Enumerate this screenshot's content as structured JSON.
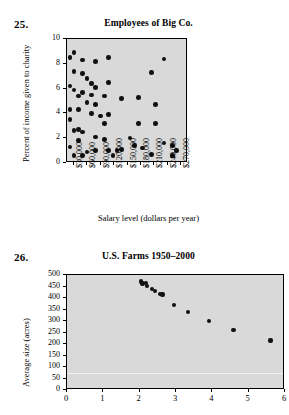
{
  "figures": [
    {
      "number": "25.",
      "title": "Employees of Big Co.",
      "xlabel": "Salary level (dollars per year)",
      "ylabel": "Percent of income given to charity",
      "ytick_labels": [
        "10",
        "8",
        "6",
        "4",
        "2",
        "0"
      ],
      "xtick_labels": [
        "$30,000",
        "$60,000",
        "$90,000",
        "$120,000",
        "$150,000",
        "$180,000",
        "$210,000",
        "$240,000",
        "$270,000"
      ]
    },
    {
      "number": "26.",
      "title": "U.S. Farms 1950–2000",
      "xlabel": "",
      "ylabel": "Average size (acres)",
      "ytick_labels": [
        "500",
        "450",
        "400",
        "350",
        "300",
        "250",
        "200",
        "150",
        "100",
        "50",
        "0"
      ],
      "xtick_labels": [
        "0",
        "1",
        "2",
        "3",
        "4",
        "5",
        "6"
      ]
    }
  ],
  "chart_data": [
    {
      "type": "scatter",
      "title": "Employees of Big Co.",
      "xlabel": "Salary level (dollars per year)",
      "ylabel": "Percent of income given to charity",
      "xlim": [
        15000,
        285000
      ],
      "ylim": [
        0,
        10
      ],
      "grid": false,
      "legend": "none",
      "marker": "filled-circle",
      "xtick_values": [
        30000,
        60000,
        90000,
        120000,
        150000,
        180000,
        210000,
        240000,
        270000
      ],
      "ytick_values": [
        0,
        2,
        4,
        6,
        8,
        10
      ],
      "points": [
        {
          "x": 22000,
          "y": 8.5
        },
        {
          "x": 22000,
          "y": 6.2
        },
        {
          "x": 22000,
          "y": 4.3
        },
        {
          "x": 22000,
          "y": 3.5
        },
        {
          "x": 22000,
          "y": 1.3
        },
        {
          "x": 31000,
          "y": 8.9
        },
        {
          "x": 31000,
          "y": 7.4
        },
        {
          "x": 31000,
          "y": 5.9
        },
        {
          "x": 31000,
          "y": 2.6
        },
        {
          "x": 31000,
          "y": 0.6
        },
        {
          "x": 41000,
          "y": 5.4
        },
        {
          "x": 41000,
          "y": 4.3
        },
        {
          "x": 41000,
          "y": 2.7
        },
        {
          "x": 41000,
          "y": 1.8
        },
        {
          "x": 50000,
          "y": 8.3
        },
        {
          "x": 50000,
          "y": 7.2
        },
        {
          "x": 50000,
          "y": 5.7
        },
        {
          "x": 50000,
          "y": 2.5
        },
        {
          "x": 50000,
          "y": 0.6
        },
        {
          "x": 60000,
          "y": 6.8
        },
        {
          "x": 60000,
          "y": 4.9
        },
        {
          "x": 60000,
          "y": 0.9
        },
        {
          "x": 70000,
          "y": 6.4
        },
        {
          "x": 70000,
          "y": 5.5
        },
        {
          "x": 70000,
          "y": 4.0
        },
        {
          "x": 79000,
          "y": 8.2
        },
        {
          "x": 79000,
          "y": 6.1
        },
        {
          "x": 79000,
          "y": 4.7
        },
        {
          "x": 79000,
          "y": 2.1
        },
        {
          "x": 79000,
          "y": 1.0
        },
        {
          "x": 90000,
          "y": 3.8
        },
        {
          "x": 99000,
          "y": 5.4
        },
        {
          "x": 99000,
          "y": 3.2
        },
        {
          "x": 99000,
          "y": 1.9
        },
        {
          "x": 108000,
          "y": 8.5
        },
        {
          "x": 108000,
          "y": 6.5
        },
        {
          "x": 108000,
          "y": 3.9
        },
        {
          "x": 108000,
          "y": 1.0
        },
        {
          "x": 118000,
          "y": 0.6
        },
        {
          "x": 127000,
          "y": 1.0
        },
        {
          "x": 137000,
          "y": 5.2
        },
        {
          "x": 137000,
          "y": 1.1
        },
        {
          "x": 156000,
          "y": 2.0
        },
        {
          "x": 166000,
          "y": 1.4
        },
        {
          "x": 175000,
          "y": 5.3
        },
        {
          "x": 175000,
          "y": 3.2
        },
        {
          "x": 184000,
          "y": 1.2
        },
        {
          "x": 203000,
          "y": 7.3
        },
        {
          "x": 203000,
          "y": 0.7
        },
        {
          "x": 212000,
          "y": 4.7
        },
        {
          "x": 212000,
          "y": 3.2
        },
        {
          "x": 231000,
          "y": 8.4
        },
        {
          "x": 231000,
          "y": 1.6
        },
        {
          "x": 250000,
          "y": 1.4
        },
        {
          "x": 250000,
          "y": 0.6
        },
        {
          "x": 259000,
          "y": 1.0
        }
      ]
    },
    {
      "type": "scatter",
      "title": "U.S. Farms 1950–2000",
      "xlabel": "",
      "ylabel": "Average size (acres)",
      "xlim": [
        0,
        6
      ],
      "ylim": [
        0,
        500
      ],
      "grid": false,
      "legend": "none",
      "marker": "filled-circle",
      "xtick_values": [
        0,
        1,
        2,
        3,
        4,
        5,
        6
      ],
      "ytick_values": [
        0,
        50,
        100,
        150,
        200,
        250,
        300,
        350,
        400,
        450,
        500
      ],
      "points": [
        {
          "x": 2.03,
          "y": 472
        },
        {
          "x": 2.08,
          "y": 463
        },
        {
          "x": 2.18,
          "y": 465
        },
        {
          "x": 2.2,
          "y": 452
        },
        {
          "x": 2.35,
          "y": 438
        },
        {
          "x": 2.42,
          "y": 432
        },
        {
          "x": 2.55,
          "y": 418
        },
        {
          "x": 2.63,
          "y": 415
        },
        {
          "x": 2.95,
          "y": 370
        },
        {
          "x": 3.33,
          "y": 338
        },
        {
          "x": 3.9,
          "y": 300
        },
        {
          "x": 4.58,
          "y": 262
        },
        {
          "x": 5.6,
          "y": 215
        }
      ]
    }
  ]
}
